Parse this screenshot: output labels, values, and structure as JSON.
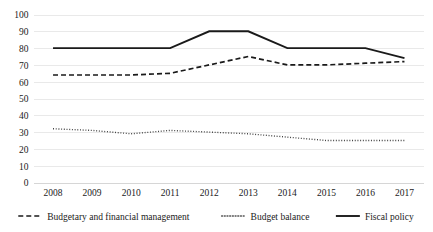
{
  "chart_data": {
    "type": "line",
    "title": "",
    "subtitle": "",
    "xlabel": "",
    "ylabel": "",
    "categories": [
      "2008",
      "2009",
      "2010",
      "2011",
      "2012",
      "2013",
      "2014",
      "2015",
      "2016",
      "2017"
    ],
    "x": [
      2008,
      2009,
      2010,
      2011,
      2012,
      2013,
      2014,
      2015,
      2016,
      2017
    ],
    "ylim": [
      0,
      100
    ],
    "yticks": [
      0,
      10,
      20,
      30,
      40,
      50,
      60,
      70,
      80,
      90,
      100
    ],
    "ytick_labels": [
      "0",
      "10",
      "20",
      "30",
      "40",
      "50",
      "60",
      "70",
      "80",
      "90",
      "100"
    ],
    "grid": true,
    "grid_axis": "y",
    "legend_position": "bottom",
    "series": [
      {
        "name": "Budgetary and financial management",
        "style": "dashed",
        "color": "#1a1a1a",
        "values": [
          64,
          64,
          64,
          65,
          70,
          75,
          70,
          70,
          71,
          72
        ]
      },
      {
        "name": "Budget balance",
        "style": "dotted",
        "color": "#444444",
        "values": [
          32,
          31,
          29,
          31,
          30,
          29,
          27,
          25,
          25,
          25
        ]
      },
      {
        "name": "Fiscal policy",
        "style": "solid",
        "color": "#1a1a1a",
        "values": [
          80,
          80,
          80,
          80,
          90,
          90,
          80,
          80,
          80,
          74
        ]
      }
    ]
  },
  "legend": {
    "items": [
      {
        "label": "Budgetary and financial management",
        "style": "dashed"
      },
      {
        "label": "Budget balance",
        "style": "dotted"
      },
      {
        "label": "Fiscal policy",
        "style": "solid"
      }
    ]
  },
  "axes": {
    "y_ticks": [
      "100",
      "90",
      "80",
      "70",
      "60",
      "50",
      "40",
      "30",
      "20",
      "10",
      "0"
    ],
    "x_ticks": [
      "2008",
      "2009",
      "2010",
      "2011",
      "2012",
      "2013",
      "2014",
      "2015",
      "2016",
      "2017"
    ]
  }
}
